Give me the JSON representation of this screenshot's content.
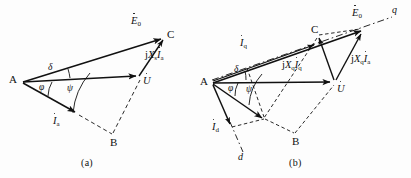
{
  "figure": {
    "background_color": "#fdfdfd",
    "line_color": "#111111",
    "captions": [
      {
        "id": "caption-a",
        "text": "(a)"
      },
      {
        "id": "caption-b",
        "text": "(b)"
      }
    ]
  },
  "diagram_a": {
    "name": "non-salient-pole-phasor-diagram",
    "vertices": [
      {
        "label": "A",
        "x": 22,
        "y": 82
      },
      {
        "label": "C",
        "x": 165,
        "y": 37
      },
      {
        "label": "B",
        "x": 112,
        "y": 137
      }
    ],
    "vertex_labels": {
      "a": "A",
      "b": "B",
      "c": "C"
    },
    "phasors": [
      {
        "name": "emf-phasor",
        "symbol": "E",
        "subscript": "0",
        "dot": true,
        "label_text": "E0"
      },
      {
        "name": "terminal-voltage-phasor",
        "symbol": "U",
        "subscript": "",
        "dot": true,
        "label_text": "U"
      },
      {
        "name": "armature-current-phasor",
        "symbol": "I",
        "subscript": "a",
        "dot": true,
        "label_text": "Ia"
      },
      {
        "name": "reactance-drop-phasor",
        "symbol": "jXsIa",
        "subscript": "",
        "dot": true,
        "label_text": "jXsIa"
      }
    ],
    "angles": [
      {
        "name": "power-angle",
        "symbol": "δ"
      },
      {
        "name": "power-factor-angle",
        "symbol": "φ"
      },
      {
        "name": "internal-angle",
        "symbol": "ψ"
      }
    ],
    "caption": "(a)"
  },
  "diagram_b": {
    "name": "salient-pole-phasor-diagram",
    "vertices": [
      {
        "label": "A",
        "x": 212,
        "y": 83
      },
      {
        "label": "C",
        "x": 318,
        "y": 32
      },
      {
        "label": "B",
        "x": 295,
        "y": 135
      }
    ],
    "vertex_labels": {
      "a": "A",
      "b": "B",
      "c": "C"
    },
    "phasors": [
      {
        "name": "emf-phasor",
        "label_text": "E0"
      },
      {
        "name": "terminal-voltage-phasor",
        "label_text": "U"
      },
      {
        "name": "q-axis-current-phasor",
        "label_text": "Iq"
      },
      {
        "name": "d-axis-current-phasor",
        "label_text": "Id"
      },
      {
        "name": "q-reactance-drop-q-current",
        "label_text": "jXqIq"
      },
      {
        "name": "q-reactance-drop-armature-current",
        "label_text": "jXqIa"
      }
    ],
    "axes": [
      {
        "name": "q-axis",
        "label": "q"
      },
      {
        "name": "d-axis",
        "label": "d"
      }
    ],
    "angles": [
      {
        "name": "power-angle",
        "symbol": "δ"
      },
      {
        "name": "power-factor-angle",
        "symbol": "φ"
      },
      {
        "name": "internal-angle",
        "symbol": "ψ"
      }
    ],
    "caption": "(b)"
  },
  "labels": {
    "E": "E",
    "E_sub": "0",
    "U": "U",
    "I": "I",
    "I_sub_a": "a",
    "I_sub_q": "q",
    "I_sub_d": "d",
    "j": "j",
    "X": "X",
    "X_sub_s": "s",
    "X_sub_q": "q",
    "q_axis": "q",
    "d_axis": "d",
    "A": "A",
    "B": "B",
    "C": "C",
    "delta": "δ",
    "phi": "φ",
    "psi": "ψ",
    "caption_a": "(a)",
    "caption_b": "(b)"
  }
}
